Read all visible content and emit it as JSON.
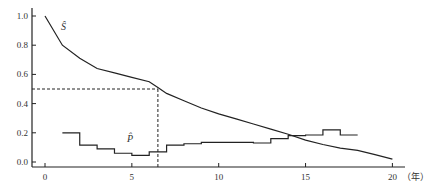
{
  "chart_data": {
    "type": "line",
    "title": "",
    "xlabel": "（年）",
    "ylabel": "",
    "xlim": [
      0,
      20
    ],
    "ylim": [
      0,
      1.0
    ],
    "grid": false,
    "legend": "inline labels",
    "x_ticks": [
      0,
      5,
      10,
      15,
      20
    ],
    "x_tick_labels": [
      "0",
      "5",
      "10",
      "15",
      "20"
    ],
    "y_ticks": [
      0.0,
      0.2,
      0.4,
      0.6,
      0.8,
      1.0
    ],
    "y_tick_labels": [
      "0.0",
      "0.2",
      "0.4",
      "0.6",
      "0.8",
      "1.0"
    ],
    "series": [
      {
        "name": "Ŝ",
        "style": "smooth line",
        "x": [
          0,
          1,
          2,
          3,
          4,
          5,
          6,
          6.5,
          7,
          8,
          9,
          10,
          11,
          12,
          13,
          14,
          15,
          16,
          17,
          18,
          19,
          20
        ],
        "values": [
          1.0,
          0.8,
          0.71,
          0.64,
          0.61,
          0.58,
          0.55,
          0.51,
          0.47,
          0.42,
          0.37,
          0.33,
          0.295,
          0.26,
          0.225,
          0.19,
          0.15,
          0.12,
          0.095,
          0.08,
          0.05,
          0.02
        ]
      },
      {
        "name": "P̂",
        "style": "step",
        "x": [
          1,
          2,
          3,
          4,
          5,
          6,
          7,
          8,
          9,
          10,
          11,
          12,
          13,
          14,
          15,
          16,
          17,
          18
        ],
        "values": [
          0.2,
          0.115,
          0.09,
          0.06,
          0.045,
          0.07,
          0.115,
          0.125,
          0.135,
          0.135,
          0.135,
          0.13,
          0.16,
          0.18,
          0.185,
          0.22,
          0.185,
          0.185
        ]
      }
    ],
    "annotations": [
      {
        "type": "hline-dashed",
        "y": 0.5,
        "x_from": 0,
        "x_to": 6.5
      },
      {
        "type": "vline-dashed",
        "x": 6.5,
        "y_from": 0,
        "y_to": 0.5
      }
    ]
  },
  "labels": {
    "s_hat": "Ŝ",
    "p_hat": "P̂",
    "x_unit": "（年）"
  }
}
